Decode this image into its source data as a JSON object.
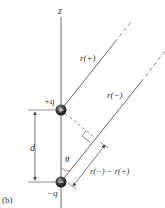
{
  "figure": {
    "panel_label": "(b)",
    "axis_label": "z",
    "charges": [
      {
        "label": "+q",
        "sign": "+",
        "name": "positive-charge"
      },
      {
        "label": "−q",
        "sign": "−",
        "name": "negative-charge"
      }
    ],
    "separation_label": "d",
    "angle_label": "θ",
    "vectors": [
      {
        "label": "r(+)",
        "name": "r-plus-line"
      },
      {
        "label": "r(−)",
        "name": "r-minus-line"
      }
    ],
    "difference_label": "r(−) − r(+)",
    "colors": {
      "line": "#555555",
      "charge_fill": "#3a3a3a",
      "text": "#333333"
    }
  }
}
